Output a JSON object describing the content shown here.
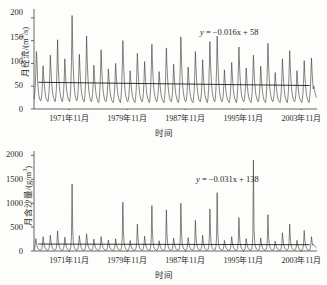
{
  "figure": {
    "kind": "two-panel-timeseries",
    "background_color": "#fdfdfb",
    "line_color": "#3b3b3b",
    "trend_color": "#111111",
    "axis_color": "#555555"
  },
  "shared": {
    "xlabel": "时间",
    "xtick_labels": [
      "1971年11月",
      "1979年11月",
      "1987年11月",
      "1995年11月",
      "2003年11月"
    ],
    "xtick_values": [
      1971.85,
      1979.85,
      1987.85,
      1995.85,
      2003.85
    ]
  },
  "panels": {
    "top": {
      "ylabel_main": "月径流/(m",
      "ylabel_sup": "3",
      "ylabel_tail": "/s)",
      "ylabel_full": "月径流/(m³/s)",
      "equation": "y = −0.016x + 58",
      "equation_lhs": "y",
      "equation_rhs": " = −0.016x + 58",
      "ytick_labels": [
        "0",
        "50",
        "100",
        "150",
        "200"
      ]
    },
    "bottom": {
      "ylabel_main": "月含沙量/(g/m",
      "ylabel_sup": "3",
      "ylabel_tail": ")",
      "ylabel_full": "月含沙量/(g/m³)",
      "equation": "y = −0.031x + 138",
      "equation_lhs": "y",
      "equation_rhs": " = −0.031x + 138",
      "ytick_labels": [
        "0",
        "500",
        "1000",
        "1500",
        "2000"
      ]
    }
  },
  "chart_data": [
    {
      "type": "line",
      "panel": "top",
      "title": "",
      "xlabel": "时间",
      "ylabel": "月径流/(m³/s)",
      "ylim": [
        0,
        215
      ],
      "yticks": [
        0,
        50,
        100,
        150,
        200
      ],
      "xlim": [
        1967.0,
        2005.6
      ],
      "grid": false,
      "legend": "none",
      "annotations": [
        {
          "text": "y = −0.016x + 58",
          "x": 1997.0,
          "y": 170,
          "role": "trend-equation"
        }
      ],
      "trendline": {
        "slope": -0.016,
        "intercept": 58,
        "equation": "y = −0.016x + 58",
        "y_start": 58.6,
        "y_end": 51.5
      },
      "series": [
        {
          "name": "月径流",
          "unit": "m³/s",
          "sampling": "monthly",
          "x_start": 1967.0,
          "x_step": 0.0833333,
          "values": [
            22,
            30,
            48,
            80,
            126,
            104,
            62,
            44,
            30,
            24,
            20,
            18,
            22,
            34,
            60,
            95,
            70,
            56,
            40,
            30,
            24,
            20,
            18,
            16,
            24,
            40,
            72,
            118,
            88,
            64,
            46,
            34,
            26,
            22,
            18,
            16,
            26,
            44,
            86,
            152,
            100,
            70,
            50,
            36,
            28,
            22,
            18,
            16,
            24,
            38,
            66,
            110,
            78,
            58,
            42,
            32,
            26,
            20,
            18,
            16,
            28,
            52,
            104,
            205,
            130,
            88,
            60,
            42,
            30,
            24,
            20,
            18,
            24,
            40,
            74,
            120,
            86,
            62,
            44,
            32,
            26,
            20,
            18,
            16,
            26,
            46,
            90,
            160,
            110,
            74,
            52,
            38,
            28,
            22,
            18,
            16,
            22,
            34,
            58,
            96,
            72,
            54,
            40,
            30,
            24,
            20,
            16,
            14,
            24,
            42,
            80,
            130,
            92,
            66,
            46,
            34,
            26,
            20,
            18,
            16,
            20,
            32,
            54,
            88,
            66,
            50,
            36,
            28,
            22,
            18,
            16,
            14,
            22,
            36,
            62,
            100,
            74,
            56,
            40,
            30,
            24,
            20,
            16,
            14,
            26,
            48,
            94,
            150,
            104,
            72,
            50,
            36,
            28,
            22,
            18,
            16,
            20,
            30,
            52,
            84,
            64,
            48,
            36,
            28,
            22,
            18,
            16,
            14,
            24,
            40,
            76,
            122,
            88,
            64,
            44,
            32,
            26,
            20,
            18,
            16,
            22,
            36,
            64,
            104,
            76,
            56,
            40,
            30,
            24,
            20,
            16,
            14,
            26,
            46,
            88,
            142,
            98,
            70,
            48,
            36,
            28,
            22,
            18,
            16,
            20,
            30,
            50,
            82,
            62,
            46,
            34,
            26,
            22,
            18,
            16,
            14,
            24,
            42,
            82,
            134,
            94,
            68,
            48,
            34,
            26,
            20,
            18,
            16,
            22,
            34,
            60,
            98,
            72,
            54,
            38,
            30,
            24,
            18,
            16,
            14,
            26,
            48,
            96,
            158,
            106,
            74,
            52,
            38,
            28,
            22,
            18,
            16,
            20,
            32,
            56,
            92,
            68,
            50,
            36,
            28,
            22,
            18,
            16,
            14,
            24,
            40,
            78,
            126,
            90,
            64,
            46,
            34,
            26,
            20,
            18,
            16,
            22,
            36,
            66,
            108,
            78,
            58,
            40,
            30,
            24,
            20,
            16,
            14,
            26,
            46,
            92,
            148,
            100,
            72,
            50,
            36,
            28,
            22,
            18,
            16,
            24,
            44,
            86,
            160,
            108,
            76,
            52,
            38,
            28,
            22,
            18,
            16,
            20,
            30,
            52,
            86,
            64,
            48,
            34,
            26,
            22,
            18,
            16,
            14,
            22,
            36,
            62,
            102,
            76,
            56,
            40,
            30,
            24,
            20,
            16,
            14,
            26,
            44,
            84,
            136,
            96,
            68,
            48,
            34,
            26,
            22,
            18,
            16,
            20,
            32,
            54,
            90,
            68,
            50,
            36,
            28,
            22,
            18,
            16,
            14,
            24,
            40,
            74,
            118,
            86,
            62,
            44,
            32,
            26,
            20,
            18,
            16,
            22,
            34,
            58,
            94,
            70,
            52,
            38,
            28,
            22,
            18,
            16,
            14,
            26,
            46,
            90,
            144,
            100,
            70,
            48,
            36,
            28,
            22,
            18,
            16,
            20,
            30,
            50,
            80,
            60,
            46,
            34,
            26,
            20,
            18,
            16,
            14,
            22,
            38,
            68,
            110,
            80,
            58,
            42,
            30,
            24,
            20,
            16,
            14,
            24,
            42,
            80,
            128,
            92,
            66,
            46,
            34,
            26,
            20,
            18,
            16,
            20,
            30,
            52,
            84,
            62,
            48,
            34,
            26,
            22,
            18,
            16,
            14,
            22,
            36,
            64,
            106,
            76,
            56,
            40,
            30,
            24,
            20,
            16,
            14,
            24,
            40,
            72,
            112,
            82,
            60,
            44,
            50,
            40,
            36,
            30,
            26
          ]
        }
      ]
    },
    {
      "type": "line",
      "panel": "bottom",
      "title": "",
      "xlabel": "时间",
      "ylabel": "月含沙量/(g/m³)",
      "ylim": [
        0,
        2050
      ],
      "yticks": [
        0,
        500,
        1000,
        1500,
        2000
      ],
      "xlim": [
        1967.0,
        2005.6
      ],
      "grid": false,
      "legend": "none",
      "annotations": [
        {
          "text": "y = −0.031x + 138",
          "x": 1997.0,
          "y": 1180,
          "role": "trend-equation"
        }
      ],
      "trendline": {
        "slope": -0.031,
        "intercept": 138,
        "equation": "y = −0.031x + 138",
        "y_start": 145,
        "y_end": 132
      },
      "series": [
        {
          "name": "月含沙量",
          "unit": "g/m³",
          "sampling": "monthly",
          "x_start": 1967.0,
          "x_step": 0.0833333,
          "values": [
            30,
            50,
            120,
            260,
            180,
            110,
            70,
            45,
            30,
            25,
            20,
            18,
            28,
            55,
            140,
            300,
            200,
            120,
            75,
            48,
            32,
            25,
            20,
            18,
            30,
            60,
            150,
            330,
            210,
            130,
            80,
            50,
            34,
            26,
            20,
            18,
            32,
            70,
            190,
            420,
            240,
            150,
            90,
            55,
            36,
            28,
            22,
            18,
            28,
            55,
            135,
            290,
            195,
            120,
            72,
            46,
            32,
            25,
            20,
            18,
            35,
            90,
            300,
            1400,
            430,
            190,
            110,
            65,
            40,
            30,
            22,
            18,
            30,
            60,
            150,
            320,
            205,
            125,
            78,
            48,
            32,
            25,
            20,
            18,
            32,
            65,
            165,
            360,
            220,
            135,
            82,
            52,
            34,
            26,
            22,
            18,
            26,
            48,
            115,
            250,
            170,
            105,
            66,
            42,
            30,
            24,
            20,
            16,
            28,
            55,
            140,
            300,
            195,
            120,
            74,
            47,
            32,
            25,
            20,
            18,
            24,
            45,
            105,
            230,
            155,
            98,
            62,
            40,
            28,
            22,
            18,
            16,
            26,
            50,
            120,
            255,
            175,
            108,
            68,
            44,
            30,
            24,
            20,
            16,
            34,
            85,
            280,
            1020,
            400,
            180,
            105,
            62,
            40,
            30,
            22,
            18,
            24,
            44,
            100,
            220,
            150,
            95,
            60,
            38,
            28,
            22,
            18,
            16,
            30,
            70,
            200,
            560,
            280,
            160,
            95,
            58,
            38,
            28,
            22,
            18,
            28,
            58,
            145,
            310,
            200,
            125,
            76,
            48,
            32,
            25,
            20,
            18,
            32,
            80,
            260,
            950,
            380,
            175,
            100,
            60,
            40,
            30,
            22,
            18,
            24,
            44,
            100,
            215,
            148,
            94,
            60,
            38,
            28,
            22,
            18,
            16,
            30,
            75,
            230,
            860,
            350,
            165,
            98,
            58,
            38,
            28,
            22,
            18,
            26,
            50,
            125,
            270,
            180,
            112,
            70,
            45,
            30,
            24,
            20,
            16,
            32,
            82,
            270,
            1000,
            395,
            178,
            104,
            62,
            40,
            30,
            22,
            18,
            26,
            52,
            130,
            280,
            185,
            115,
            72,
            46,
            32,
            24,
            20,
            16,
            30,
            70,
            210,
            640,
            300,
            162,
            96,
            58,
            38,
            28,
            22,
            18,
            28,
            58,
            150,
            330,
            205,
            128,
            78,
            50,
            34,
            26,
            20,
            18,
            32,
            80,
            255,
            880,
            360,
            170,
            100,
            60,
            40,
            30,
            22,
            18,
            34,
            88,
            290,
            1220,
            420,
            185,
            108,
            64,
            40,
            30,
            22,
            18,
            24,
            44,
            100,
            220,
            150,
            95,
            60,
            38,
            28,
            22,
            18,
            16,
            28,
            56,
            140,
            300,
            195,
            122,
            74,
            47,
            32,
            25,
            20,
            18,
            30,
            72,
            215,
            700,
            320,
            165,
            97,
            58,
            38,
            28,
            22,
            18,
            26,
            50,
            120,
            260,
            175,
            110,
            68,
            44,
            30,
            24,
            20,
            16,
            36,
            95,
            320,
            1900,
            480,
            200,
            115,
            68,
            42,
            32,
            24,
            20,
            26,
            52,
            128,
            275,
            182,
            114,
            70,
            45,
            32,
            24,
            20,
            16,
            30,
            74,
            225,
            760,
            330,
            168,
            98,
            58,
            38,
            28,
            22,
            18,
            24,
            42,
            96,
            205,
            142,
            90,
            58,
            36,
            26,
            22,
            18,
            16,
            28,
            60,
            160,
            380,
            230,
            140,
            85,
            52,
            35,
            26,
            22,
            18,
            30,
            68,
            195,
            560,
            275,
            155,
            92,
            56,
            37,
            28,
            22,
            18,
            24,
            44,
            102,
            225,
            152,
            96,
            60,
            38,
            28,
            22,
            18,
            16,
            28,
            62,
            175,
            430,
            245,
            145,
            88,
            54,
            36,
            27,
            22,
            18,
            26,
            54,
            135,
            300,
            190,
            120,
            140,
            130,
            110,
            95,
            80,
            70
          ]
        }
      ]
    }
  ]
}
